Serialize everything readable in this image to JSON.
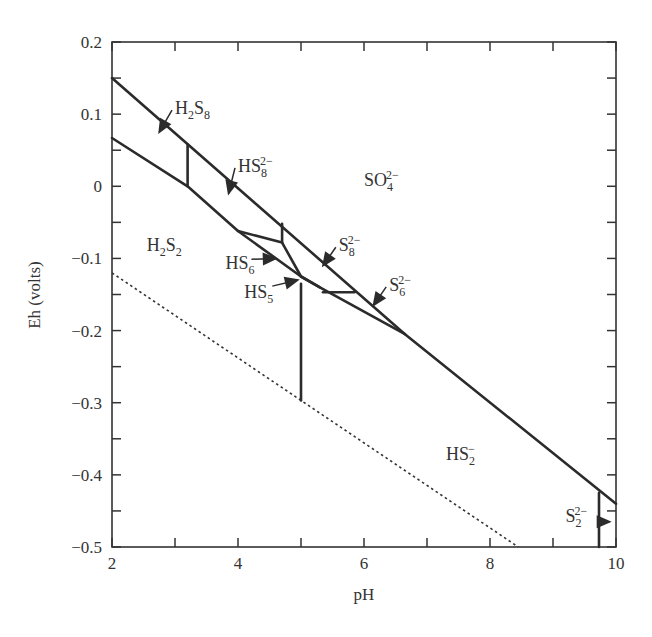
{
  "chart_data": {
    "type": "line",
    "title": "",
    "xlabel": "pH",
    "ylabel": "Eh (volts)",
    "xlim": [
      2,
      10
    ],
    "ylim": [
      -0.5,
      0.2
    ],
    "x_ticks_major": [
      2,
      4,
      6,
      8,
      10
    ],
    "x_ticks_minor_step": 1,
    "y_ticks_major": [
      0.2,
      0.1,
      0,
      -0.1,
      -0.2,
      -0.3,
      -0.4,
      -0.5
    ],
    "y_ticks_minor_step": 0.05,
    "x_tick_labels": [
      "2",
      "4",
      "6",
      "8",
      "10"
    ],
    "y_tick_labels": [
      "0.2",
      "0.1",
      "0",
      "-0.1",
      "-0.2",
      "-0.3",
      "-0.4",
      "-0.5"
    ],
    "grid": false,
    "legend": null,
    "regions": [
      {
        "label": "SO4 2-",
        "base": "SO",
        "sub": "4",
        "sup": "2−",
        "x": 6.0,
        "y": 0.0
      },
      {
        "label": "H2S2",
        "base": "H",
        "sub": "2",
        "base2": "S",
        "sub2": "2",
        "x": 2.55,
        "y": -0.09
      },
      {
        "label": "HS2-",
        "base": "HS",
        "sub": "2",
        "sup": "−",
        "x": 7.3,
        "y": -0.38
      },
      {
        "label": "H2S8",
        "base": "H",
        "sub": "2",
        "base2": "S",
        "sub2": "8",
        "x": 3.0,
        "y": 0.1,
        "arrow_to": [
          2.75,
          0.075
        ]
      },
      {
        "label": "HS8 2-",
        "base": "HS",
        "sub": "8",
        "sup": "2−",
        "x": 4.0,
        "y": 0.02,
        "arrow_to": [
          3.85,
          -0.01
        ]
      },
      {
        "label": "S8 2-",
        "base": "S",
        "sub": "8",
        "sup": "2−",
        "x": 5.6,
        "y": -0.09,
        "arrow_to": [
          5.35,
          -0.11
        ]
      },
      {
        "label": "S6 2-",
        "base": "S",
        "sub": "6",
        "sup": "2−",
        "x": 6.4,
        "y": -0.145,
        "arrow_to": [
          6.15,
          -0.165
        ]
      },
      {
        "label": "HS6",
        "base": "HS",
        "sub": "6",
        "x": 3.8,
        "y": -0.115,
        "arrow_to": [
          4.6,
          -0.1
        ]
      },
      {
        "label": "HS5",
        "base": "HS",
        "sub": "5",
        "x": 4.1,
        "y": -0.155,
        "arrow_to": [
          4.95,
          -0.13
        ]
      },
      {
        "label": "S2 2-",
        "base": "S",
        "sub": "2",
        "sup": "2−",
        "x": 9.2,
        "y": -0.465,
        "arrow_to": [
          9.9,
          -0.465
        ]
      }
    ],
    "series": [
      {
        "name": "upper boundary (SO4 2-)",
        "style": "solid",
        "points": [
          [
            2,
            0.15
          ],
          [
            6.65,
            -0.205
          ],
          [
            10,
            -0.44
          ]
        ]
      },
      {
        "name": "lower boundary (H2S2 / HS2-)",
        "style": "solid",
        "points": [
          [
            2,
            0.067
          ],
          [
            3.2,
            0.0
          ],
          [
            4.0,
            -0.062
          ],
          [
            5.0,
            -0.125
          ],
          [
            5.3,
            -0.14
          ],
          [
            6.65,
            -0.205
          ]
        ]
      },
      {
        "name": "H2S8 / HS8 2- boundary",
        "style": "solid",
        "points": [
          [
            3.2,
            0.0
          ],
          [
            3.2,
            0.058
          ]
        ]
      },
      {
        "name": "HS8 2- / S8 2- boundary",
        "style": "solid",
        "points": [
          [
            4.7,
            -0.052
          ],
          [
            4.7,
            -0.078
          ]
        ]
      },
      {
        "name": "HS6 upper boundary",
        "style": "solid",
        "points": [
          [
            4.0,
            -0.062
          ],
          [
            4.7,
            -0.078
          ],
          [
            5.0,
            -0.125
          ],
          [
            5.3,
            -0.14
          ]
        ]
      },
      {
        "name": "S8 2- / S6 2- boundary",
        "style": "solid",
        "points": [
          [
            5.35,
            -0.147
          ],
          [
            5.85,
            -0.147
          ]
        ]
      },
      {
        "name": "H2S2 / HS2- boundary",
        "style": "solid",
        "points": [
          [
            5.0,
            -0.135
          ],
          [
            5.0,
            -0.297
          ]
        ]
      },
      {
        "name": "HS2- / S2 2- boundary",
        "style": "solid",
        "points": [
          [
            9.73,
            -0.425
          ],
          [
            9.73,
            -0.5
          ]
        ]
      },
      {
        "name": "water stability (dotted)",
        "style": "dotted",
        "points": [
          [
            2,
            -0.12
          ],
          [
            8.45,
            -0.5
          ]
        ]
      }
    ]
  }
}
